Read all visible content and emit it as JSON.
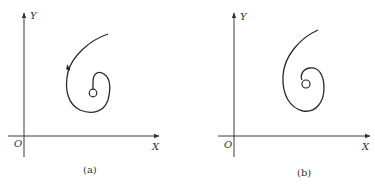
{
  "figure": {
    "panels": [
      {
        "id": "a",
        "caption": "(a)",
        "axes": {
          "x_label": "X",
          "y_label": "Y",
          "origin_label": "O"
        },
        "curve": {
          "type": "spiral",
          "direction_arrow": true,
          "description": "trajectory spiraling inward to a point (circle)"
        }
      },
      {
        "id": "b",
        "caption": "(b)",
        "axes": {
          "x_label": "X",
          "y_label": "Y",
          "origin_label": "O"
        },
        "curve": {
          "type": "spiral",
          "direction_arrow": false,
          "description": "trajectory spiraling inward to a point (circle)"
        }
      }
    ]
  }
}
